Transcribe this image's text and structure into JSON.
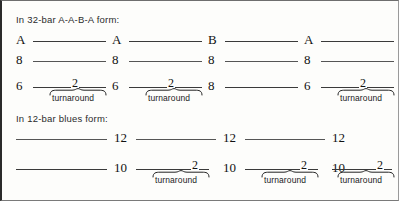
{
  "figure": {
    "sections": [
      {
        "id": "thirtytwo-bar",
        "heading": "In 32-bar A-A-B-A form:",
        "rows": [
          {
            "id": "section-letters",
            "cells": [
              {
                "label": "A",
                "rule": true,
                "turnaround": false
              },
              {
                "label": "A",
                "rule": true,
                "turnaround": false
              },
              {
                "label": "B",
                "rule": true,
                "turnaround": false
              },
              {
                "label": "A",
                "rule": true,
                "turnaround": false
              }
            ]
          },
          {
            "id": "bar-counts-eight",
            "cells": [
              {
                "label": "8",
                "rule": true,
                "turnaround": false
              },
              {
                "label": "8",
                "rule": true,
                "turnaround": false
              },
              {
                "label": "8",
                "rule": true,
                "turnaround": false
              },
              {
                "label": "8",
                "rule": true,
                "turnaround": false
              }
            ]
          },
          {
            "id": "bar-split-turnaround",
            "cells": [
              {
                "label": "6",
                "rule": true,
                "turnaround": true,
                "turnaround_bars": "2",
                "turnaround_label": "turnaround"
              },
              {
                "label": "6",
                "rule": true,
                "turnaround": true,
                "turnaround_bars": "2",
                "turnaround_label": "turnaround"
              },
              {
                "label": "8",
                "rule": true,
                "turnaround": false
              },
              {
                "label": "6",
                "rule": true,
                "turnaround": true,
                "turnaround_bars": "2",
                "turnaround_label": "turnaround"
              }
            ]
          }
        ]
      },
      {
        "id": "twelve-bar-blues",
        "heading": "In 12-bar blues form:",
        "rows": [
          {
            "id": "bar-counts-twelve",
            "cells": [
              {
                "label": "12",
                "rule": true,
                "turnaround": false
              },
              {
                "label": "12",
                "rule": true,
                "turnaround": false
              },
              {
                "label": "12",
                "rule": true,
                "turnaround": false
              }
            ]
          },
          {
            "id": "bar-split-turnaround-blues",
            "cells": [
              {
                "label": "10",
                "rule": true,
                "turnaround": true,
                "turnaround_bars": "2",
                "turnaround_label": "turnaround"
              },
              {
                "label": "10",
                "rule": true,
                "turnaround": true,
                "turnaround_bars": "2",
                "turnaround_label": "turnaround"
              },
              {
                "label": "10",
                "rule": true,
                "turnaround": true,
                "turnaround_bars": "2",
                "turnaround_label": "turnaround"
              }
            ]
          }
        ]
      }
    ]
  }
}
